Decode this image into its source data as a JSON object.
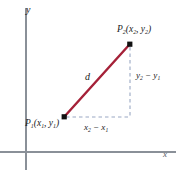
{
  "figure": {
    "background": "#ffffff"
  },
  "axes": {
    "y_label": "y",
    "x_label": "x",
    "color": "#8a9098",
    "origin": {
      "x": 26,
      "y": 152
    }
  },
  "points": {
    "p1": {
      "label_prefix": "P",
      "label_sub": "1",
      "label_coords": "(x",
      "label_full": "P",
      "sub1": "1",
      "open": "(x",
      "sub2": "1",
      "comma": ", y",
      "sub3": "1",
      "close": ")",
      "pixel": {
        "x": 64,
        "y": 117
      }
    },
    "p2": {
      "label_full": "P",
      "sub1": "2",
      "open": "(x",
      "sub2": "2",
      "comma": ", y",
      "sub3": "2",
      "close": ")",
      "pixel": {
        "x": 130,
        "y": 44
      }
    }
  },
  "segments": {
    "distance": {
      "label": "d",
      "color": "#a52138"
    },
    "vertical_leg": {
      "label_y": "y",
      "sub2": "2",
      "minus": " − y",
      "sub1": "1",
      "color": "#9aa8c4"
    },
    "horizontal_leg": {
      "label_x": "x",
      "sub2": "2",
      "minus": " − x",
      "sub1": "1",
      "color": "#9aa8c4"
    }
  },
  "colors": {
    "line_red": "#a52138",
    "dashed_blue": "#9aa8c4",
    "axis_gray": "#8a9098",
    "point_black": "#111111",
    "text": "#1a1a1a"
  }
}
